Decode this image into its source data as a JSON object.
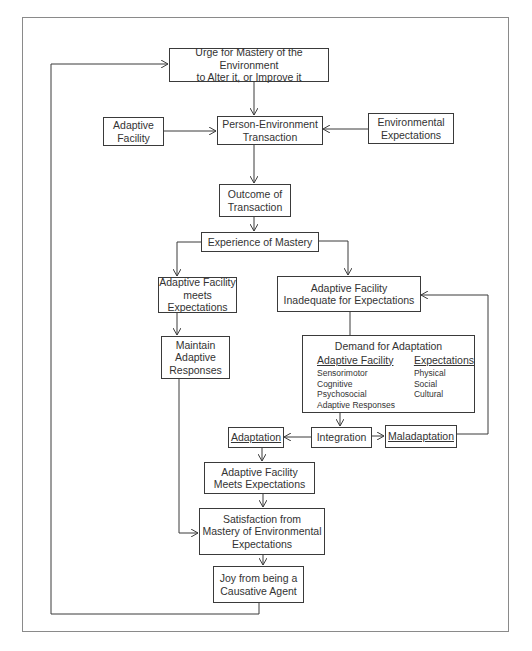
{
  "diagram": {
    "nodes": {
      "urge": {
        "line1": "Urge for Mastery of the Environment",
        "line2": "to Alter it, or Improve it"
      },
      "adaptive_facility": {
        "line1": "Adaptive",
        "line2": "Facility"
      },
      "person_environment": {
        "line1": "Person-Environment",
        "line2": "Transaction"
      },
      "environmental_expectations": {
        "line1": "Environmental",
        "line2": "Expectations"
      },
      "outcome": {
        "line1": "Outcome of",
        "line2": "Transaction"
      },
      "experience": {
        "line1": "Experience of Mastery"
      },
      "af_meets": {
        "line1": "Adaptive Facility",
        "line2": "meets Expectations"
      },
      "af_inadequate": {
        "line1": "Adaptive Facility",
        "line2": "Inadequate for Expectations"
      },
      "maintain": {
        "line1": "Maintain Adaptive",
        "line2": "Responses"
      },
      "demand": {
        "title": "Demand for Adaptation",
        "left_header": "Adaptive Facility",
        "left_items": [
          "Sensorimotor",
          "Cognitive",
          "Psychosocial",
          "Adaptive Responses"
        ],
        "right_header": "Expectations",
        "right_items": [
          "Physical",
          "Social",
          "Cultural"
        ]
      },
      "adaptation": {
        "line1": "Adaptation"
      },
      "integration": {
        "line1": "Integration"
      },
      "maladaptation": {
        "line1": "Maladaptation"
      },
      "af_meets_2": {
        "line1": "Adaptive Facility",
        "line2": "Meets Expectations"
      },
      "satisfaction": {
        "line1": "Satisfaction from",
        "line2": "Mastery of Environmental",
        "line3": "Expectations"
      },
      "joy": {
        "line1": "Joy from being a",
        "line2": "Causative Agent"
      }
    },
    "colors": {
      "line": "#3a3a3a",
      "frame": "#8a8a8a",
      "background": "#ffffff"
    }
  }
}
